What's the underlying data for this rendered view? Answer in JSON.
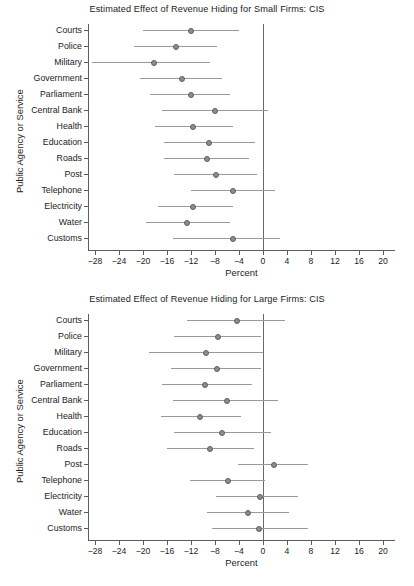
{
  "figure": {
    "axis_title_y": "Public Agency or Service",
    "axis_title_x": "Percent",
    "x_tick_labels": [
      "−28",
      "−24",
      "−20",
      "−16",
      "−12",
      "−8",
      "−4",
      "0",
      "4",
      "8",
      "12",
      "16",
      "20"
    ],
    "marker_color": "#8d8d8d",
    "ci_color": "#9a9a9a",
    "axis_color": "#5c5c5c"
  },
  "chart_data": [
    {
      "type": "scatter",
      "title": "Estimated Effect of Revenue Hiding for Small Firms: CIS",
      "xlabel": "Percent",
      "ylabel": "Public Agency or Service",
      "xlim": [
        -30,
        21
      ],
      "xticks": [
        -28,
        -24,
        -20,
        -16,
        -12,
        -8,
        -4,
        0,
        4,
        8,
        12,
        16,
        20
      ],
      "grid": false,
      "legend": "none",
      "reference_line_x": 0,
      "categories": [
        "Courts",
        "Police",
        "Military",
        "Government",
        "Parliament",
        "Central Bank",
        "Health",
        "Education",
        "Roads",
        "Post",
        "Telephone",
        "Electricity",
        "Water",
        "Customs"
      ],
      "values": [
        -12.0,
        -14.5,
        -18.2,
        -13.5,
        -12.0,
        -8.0,
        -11.6,
        -9.0,
        -9.3,
        -7.8,
        -5.0,
        -11.7,
        -12.7,
        -5.0
      ],
      "ci_low": [
        -20.0,
        -21.5,
        -28.5,
        -20.5,
        -18.8,
        -16.8,
        -18.0,
        -16.5,
        -16.5,
        -14.8,
        -12.0,
        -17.5,
        -19.5,
        -15.0
      ],
      "ci_high": [
        -4.0,
        -7.7,
        -8.8,
        -6.8,
        -5.5,
        0.8,
        -5.0,
        -1.3,
        -2.3,
        -1.0,
        2.0,
        -5.0,
        -5.5,
        2.8
      ]
    },
    {
      "type": "scatter",
      "title": "Estimated Effect of Revenue Hiding for Large Firms: CIS",
      "xlabel": "Percent",
      "ylabel": "Public Agency or Service",
      "xlim": [
        -30,
        21
      ],
      "xticks": [
        -28,
        -24,
        -20,
        -16,
        -12,
        -8,
        -4,
        0,
        4,
        8,
        12,
        16,
        20
      ],
      "grid": false,
      "legend": "none",
      "reference_line_x": 0,
      "categories": [
        "Courts",
        "Police",
        "Military",
        "Government",
        "Parliament",
        "Central Bank",
        "Health",
        "Education",
        "Roads",
        "Post",
        "Telephone",
        "Electricity",
        "Water",
        "Customs"
      ],
      "values": [
        -4.3,
        -7.5,
        -9.5,
        -7.6,
        -9.7,
        -6.0,
        -10.5,
        -6.8,
        -8.9,
        1.8,
        -5.8,
        -0.5,
        -2.5,
        -0.6
      ],
      "ci_low": [
        -12.7,
        -14.8,
        -19.0,
        -15.3,
        -16.8,
        -15.0,
        -17.0,
        -14.9,
        -16.0,
        -4.2,
        -12.2,
        -7.8,
        -9.3,
        -8.5
      ],
      "ci_high": [
        3.6,
        -0.4,
        0.0,
        -0.3,
        -1.8,
        2.5,
        -3.7,
        1.3,
        -1.5,
        7.5,
        0.3,
        5.9,
        4.3,
        7.5
      ]
    }
  ]
}
